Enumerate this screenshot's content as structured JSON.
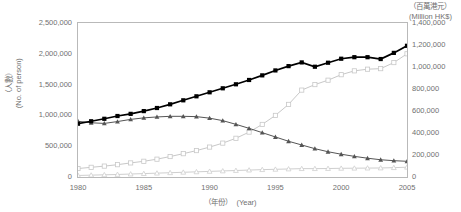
{
  "chart_data": {
    "type": "line",
    "title": "",
    "xlabel_zh": "（年份）",
    "xlabel_en": "(Year)",
    "x": [
      1980,
      1981,
      1982,
      1983,
      1984,
      1985,
      1986,
      1987,
      1988,
      1989,
      1990,
      1991,
      1992,
      1993,
      1994,
      1995,
      1996,
      1997,
      1998,
      1999,
      2000,
      2001,
      2002,
      2003,
      2004,
      2005
    ],
    "xlim": [
      1980,
      2005
    ],
    "xticks": [
      1980,
      1985,
      1990,
      1995,
      2000,
      2005
    ],
    "grid": false,
    "legend": "none",
    "axes": {
      "left": {
        "unit_zh": "（人數）",
        "unit_en": "(No. of person)",
        "ylim": [
          0,
          2500000
        ],
        "ticks": [
          "0",
          "500,000",
          "1,000,000",
          "1,500,000",
          "2,000,000",
          "2,500,000"
        ],
        "tick_values": [
          0,
          500000,
          1000000,
          1500000,
          2000000,
          2500000
        ]
      },
      "right": {
        "unit_zh": "（百萬港元）",
        "unit_en": "(Million HK$)",
        "ylim": [
          0,
          1400000
        ],
        "ticks": [
          "0",
          "200,000",
          "400,000",
          "600,000",
          "800,000",
          "1,000,000",
          "1,200,000",
          "1,400,000"
        ],
        "tick_values": [
          0,
          200000,
          400000,
          600000,
          800000,
          1000000,
          1200000,
          1400000
        ]
      }
    },
    "series": [
      {
        "name": "series-black-square",
        "axis": "left",
        "marker": "filled-square",
        "color": "#000000",
        "values": [
          865000,
          905000,
          945000,
          990000,
          1025000,
          1070000,
          1120000,
          1180000,
          1245000,
          1310000,
          1375000,
          1440000,
          1505000,
          1575000,
          1650000,
          1730000,
          1800000,
          1860000,
          1790000,
          1855000,
          1920000,
          1945000,
          1945000,
          1915000,
          2015000,
          2130000
        ]
      },
      {
        "name": "series-dark-triangle",
        "axis": "left",
        "marker": "filled-triangle",
        "color": "#555555",
        "values": [
          905000,
          880000,
          870000,
          900000,
          935000,
          960000,
          975000,
          985000,
          985000,
          980000,
          955000,
          915000,
          855000,
          790000,
          720000,
          650000,
          580000,
          520000,
          460000,
          410000,
          370000,
          335000,
          305000,
          280000,
          265000,
          255000
        ]
      },
      {
        "name": "series-light-square",
        "axis": "right",
        "marker": "open-square",
        "color": "#c8c8c8",
        "values": [
          77000,
          88000,
          99000,
          112000,
          128000,
          143000,
          162000,
          186000,
          212000,
          240000,
          272000,
          308000,
          352000,
          408000,
          478000,
          560000,
          660000,
          790000,
          840000,
          880000,
          930000,
          965000,
          980000,
          985000,
          1040000,
          1120000
        ]
      },
      {
        "name": "series-light-triangle",
        "axis": "right",
        "marker": "open-triangle",
        "color": "#cfcfcf",
        "values": [
          14000,
          17000,
          20000,
          23000,
          27000,
          31000,
          35000,
          39000,
          43000,
          47000,
          51000,
          55000,
          59000,
          63000,
          67000,
          70000,
          73000,
          76000,
          76000,
          77000,
          79000,
          80000,
          81000,
          82000,
          85000,
          89000
        ]
      }
    ]
  }
}
